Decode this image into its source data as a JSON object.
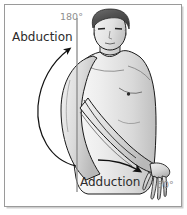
{
  "figure": {
    "frame": {
      "border_color": "#9a9a9a",
      "background_color": "#ffffff",
      "outer_shadow_color": "#c8c8c8"
    },
    "labels": {
      "abduction": "Abduction",
      "adduction": "Adduction",
      "angle_top": "180°",
      "angle_bottom": "50°"
    },
    "colors": {
      "label_text": "#2b2b2b",
      "angle_text": "#8e8e8e",
      "outline": "#1a1a1a",
      "skin_light": "#f0f0f0",
      "skin_mid": "#d8d8d8",
      "skin_shadow": "#b4b4b4",
      "hair_dark": "#4a4a4a",
      "hair_light": "#7d7d7d",
      "reference_line": "#8a8a8a",
      "arrow": "#111111"
    },
    "annotations": {
      "reference_line_name": "vertical-reference-axis",
      "arc_arrow_name": "abduction-arc-arrow",
      "straight_arrow_name": "adduction-arrow"
    }
  }
}
